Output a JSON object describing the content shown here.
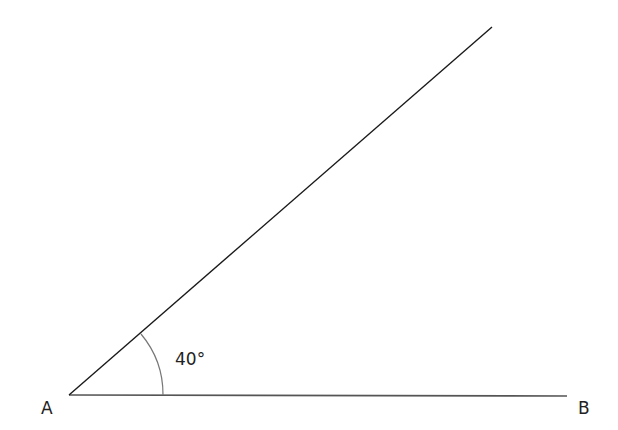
{
  "diagram": {
    "type": "geometry-angle",
    "vertex": {
      "label": "A",
      "x": 69,
      "y": 395
    },
    "ray_base": {
      "end_label": "B",
      "x2": 567,
      "y2": 396
    },
    "ray_upper": {
      "x2": 492,
      "y2": 27
    },
    "angle": {
      "value_label": "40°",
      "degrees": 40,
      "arc_radius": 94
    },
    "colors": {
      "line": "#1a1a1a",
      "arc": "#777777",
      "text": "#222222"
    }
  }
}
